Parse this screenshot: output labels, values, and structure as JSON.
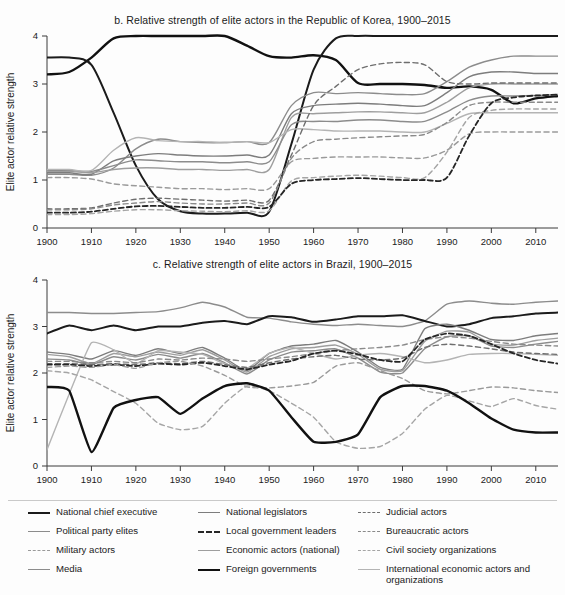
{
  "figure": {
    "panels": [
      {
        "id": "b",
        "title": "b. Relative strength of elite actors in the Republic of Korea, 1900–2015",
        "ylabel": "Elite actor relative strength"
      },
      {
        "id": "c",
        "title": "c. Relative strength of elite actors in Brazil, 1900–2015",
        "ylabel": "Elite actor relative strength"
      }
    ]
  },
  "legend": {
    "columns": [
      [
        {
          "label": "National chief executive",
          "key": "national_chief_executive",
          "color": "#1b1b1b",
          "dash": "solid",
          "width": 2.0
        },
        {
          "label": "Political party elites",
          "key": "political_party_elites",
          "color": "#8c8c8c",
          "dash": "solid",
          "width": 1.4
        },
        {
          "label": "Military actors",
          "key": "military_actors",
          "color": "#9a9a9a",
          "dash": "dashed",
          "width": 1.4
        },
        {
          "label": "Media",
          "key": "media",
          "color": "#8c8c8c",
          "dash": "solid",
          "width": 1.4
        }
      ],
      [
        {
          "label": "National legislators",
          "key": "national_legislators",
          "color": "#7d7d7d",
          "dash": "solid",
          "width": 1.4
        },
        {
          "label": "Local government leaders",
          "key": "local_government_leaders",
          "color": "#262626",
          "dash": "dashed",
          "width": 1.8
        },
        {
          "label": "Economic actors (national)",
          "key": "economic_actors_national",
          "color": "#9e9e9e",
          "dash": "solid",
          "width": 1.4
        },
        {
          "label": "Foreign governments",
          "key": "foreign_governments",
          "color": "#111111",
          "dash": "solid",
          "width": 2.4
        }
      ],
      [
        {
          "label": "Judicial actors",
          "key": "judicial_actors",
          "color": "#6e6e6e",
          "dash": "dashed",
          "width": 1.4
        },
        {
          "label": "Bureaucratic actors",
          "key": "bureaucratic_actors",
          "color": "#8a8a8a",
          "dash": "dashed",
          "width": 1.4
        },
        {
          "label": "Civil society organizations",
          "key": "civil_society_organizations",
          "color": "#a5a5a5",
          "dash": "dashed",
          "width": 1.4
        },
        {
          "label": "International economic actors and organizations",
          "key": "international_economic_actors",
          "color": "#b4b4b4",
          "dash": "solid",
          "width": 1.4
        }
      ]
    ]
  },
  "chart_data": [
    {
      "type": "line",
      "id": "b",
      "title": "b. Relative strength of elite actors in the Republic of Korea, 1900–2015",
      "xlabel": "",
      "ylabel": "Elite actor relative strength",
      "xlim": [
        1900,
        2015
      ],
      "ylim": [
        0,
        4
      ],
      "yticks": [
        0,
        1,
        2,
        3,
        4
      ],
      "xticks": [
        1900,
        1910,
        1920,
        1930,
        1940,
        1950,
        1960,
        1970,
        1980,
        1990,
        2000,
        2010
      ],
      "grid": false,
      "legend_position": "below-figure",
      "x": [
        1900,
        1905,
        1910,
        1915,
        1920,
        1925,
        1930,
        1935,
        1940,
        1945,
        1950,
        1955,
        1960,
        1965,
        1970,
        1975,
        1980,
        1985,
        1990,
        1995,
        2000,
        2005,
        2010,
        2015
      ],
      "series": [
        {
          "name": "Foreign governments",
          "values": [
            3.2,
            3.25,
            3.55,
            3.95,
            4.0,
            4.0,
            4.0,
            4.0,
            4.0,
            3.8,
            3.58,
            3.55,
            3.6,
            3.5,
            3.02,
            3.0,
            3.0,
            2.98,
            2.92,
            2.95,
            2.88,
            2.6,
            2.7,
            2.75
          ]
        },
        {
          "name": "National chief executive",
          "values": [
            3.55,
            3.55,
            3.4,
            2.4,
            1.3,
            0.6,
            0.35,
            0.3,
            0.3,
            0.32,
            0.34,
            1.75,
            3.3,
            3.95,
            4.0,
            4.0,
            4.0,
            4.0,
            4.0,
            4.0,
            4.0,
            4.0,
            4.0,
            4.0
          ]
        },
        {
          "name": "Political party elites",
          "values": [
            1.12,
            1.12,
            1.1,
            1.25,
            1.65,
            1.85,
            1.8,
            1.78,
            1.78,
            1.8,
            1.78,
            2.55,
            2.82,
            2.8,
            2.82,
            2.8,
            2.78,
            2.8,
            3.05,
            3.35,
            3.5,
            3.58,
            3.58,
            3.58
          ]
        },
        {
          "name": "National legislators",
          "values": [
            1.15,
            1.15,
            1.12,
            1.4,
            1.5,
            1.55,
            1.52,
            1.5,
            1.5,
            1.52,
            1.52,
            2.38,
            2.55,
            2.58,
            2.6,
            2.58,
            2.55,
            2.55,
            2.82,
            3.15,
            3.25,
            3.25,
            3.22,
            3.22
          ]
        },
        {
          "name": "Economic actors (national)",
          "values": [
            1.18,
            1.18,
            1.15,
            1.22,
            1.25,
            1.25,
            1.22,
            1.22,
            1.2,
            1.22,
            1.22,
            2.3,
            2.38,
            2.4,
            2.42,
            2.42,
            2.4,
            2.4,
            2.62,
            2.92,
            3.0,
            3.0,
            3.0,
            3.0
          ]
        },
        {
          "name": "Media",
          "values": [
            1.2,
            1.2,
            1.18,
            1.3,
            1.42,
            1.4,
            1.38,
            1.38,
            1.36,
            1.38,
            1.38,
            2.15,
            2.22,
            2.22,
            2.25,
            2.25,
            2.22,
            2.22,
            2.42,
            2.66,
            2.75,
            2.75,
            2.76,
            2.78
          ]
        },
        {
          "name": "International economic actors and organizations",
          "values": [
            1.22,
            1.22,
            1.2,
            1.62,
            1.88,
            1.82,
            1.8,
            1.8,
            1.78,
            1.8,
            1.78,
            2.05,
            2.05,
            2.02,
            2.02,
            2.02,
            2.0,
            2.0,
            2.18,
            2.38,
            2.4,
            2.4,
            2.4,
            2.4
          ]
        },
        {
          "name": "Military actors",
          "values": [
            1.05,
            1.05,
            1.02,
            0.92,
            0.88,
            0.85,
            0.82,
            0.82,
            0.8,
            0.82,
            0.82,
            1.38,
            1.45,
            1.48,
            1.48,
            1.48,
            1.46,
            1.46,
            1.62,
            1.96,
            2.0,
            2.0,
            2.0,
            2.0
          ]
        },
        {
          "name": "Judicial actors",
          "values": [
            0.4,
            0.4,
            0.42,
            0.52,
            0.6,
            0.62,
            0.6,
            0.58,
            0.56,
            0.58,
            0.58,
            1.52,
            2.55,
            2.95,
            3.3,
            3.42,
            3.45,
            3.4,
            3.05,
            3.0,
            3.02,
            3.02,
            3.02,
            3.02
          ]
        },
        {
          "name": "Bureaucratic actors",
          "values": [
            0.38,
            0.38,
            0.4,
            0.48,
            0.52,
            0.55,
            0.52,
            0.5,
            0.5,
            0.52,
            0.52,
            1.45,
            1.8,
            1.85,
            1.88,
            1.9,
            1.92,
            1.95,
            2.2,
            2.55,
            2.62,
            2.62,
            2.62,
            2.62
          ]
        },
        {
          "name": "Civil society organizations",
          "values": [
            0.28,
            0.28,
            0.3,
            0.35,
            0.38,
            0.38,
            0.36,
            0.35,
            0.34,
            0.36,
            0.36,
            0.98,
            1.05,
            1.08,
            1.1,
            1.08,
            1.05,
            1.05,
            1.58,
            2.3,
            2.45,
            2.48,
            2.48,
            2.48
          ]
        },
        {
          "name": "Local government leaders",
          "values": [
            0.32,
            0.32,
            0.34,
            0.4,
            0.45,
            0.46,
            0.44,
            0.42,
            0.42,
            0.44,
            0.44,
            0.92,
            1.0,
            1.02,
            1.04,
            1.02,
            1.0,
            1.0,
            1.05,
            1.92,
            2.6,
            2.72,
            2.76,
            2.78
          ]
        }
      ]
    },
    {
      "type": "line",
      "id": "c",
      "title": "c. Relative strength of elite actors in Brazil, 1900–2015",
      "xlabel": "",
      "ylabel": "Elite actor relative strength",
      "xlim": [
        1900,
        2015
      ],
      "ylim": [
        0,
        4
      ],
      "yticks": [
        0,
        1,
        2,
        3,
        4
      ],
      "xticks": [
        1900,
        1910,
        1920,
        1930,
        1940,
        1950,
        1960,
        1970,
        1980,
        1990,
        2000,
        2010
      ],
      "grid": false,
      "legend_position": "below-figure",
      "x": [
        1900,
        1905,
        1910,
        1915,
        1920,
        1925,
        1930,
        1935,
        1940,
        1945,
        1950,
        1955,
        1960,
        1965,
        1970,
        1975,
        1980,
        1985,
        1990,
        1995,
        2000,
        2005,
        2010,
        2015
      ],
      "series": [
        {
          "name": "Political party elites",
          "values": [
            3.3,
            3.3,
            3.28,
            3.28,
            3.3,
            3.32,
            3.4,
            3.52,
            3.42,
            3.2,
            3.18,
            3.1,
            3.05,
            3.02,
            3.05,
            3.02,
            3.0,
            3.12,
            3.48,
            3.55,
            3.5,
            3.48,
            3.52,
            3.55
          ]
        },
        {
          "name": "National chief executive",
          "values": [
            2.85,
            3.02,
            2.92,
            3.02,
            2.92,
            3.0,
            3.0,
            3.08,
            3.12,
            3.05,
            3.22,
            3.2,
            3.1,
            3.15,
            3.22,
            3.22,
            3.24,
            3.12,
            3.0,
            3.05,
            3.18,
            3.22,
            3.28,
            3.3
          ]
        },
        {
          "name": "National legislators",
          "values": [
            2.45,
            2.4,
            2.3,
            2.48,
            2.38,
            2.52,
            2.42,
            2.55,
            2.32,
            2.05,
            2.42,
            2.58,
            2.62,
            2.7,
            2.45,
            2.12,
            2.08,
            2.95,
            3.05,
            2.92,
            2.72,
            2.7,
            2.8,
            2.85
          ]
        },
        {
          "name": "Economic actors (national)",
          "values": [
            2.4,
            2.35,
            2.2,
            2.42,
            2.35,
            2.45,
            2.38,
            2.5,
            2.28,
            2.02,
            2.35,
            2.52,
            2.55,
            2.6,
            2.4,
            2.08,
            2.05,
            2.68,
            2.9,
            2.88,
            2.62,
            2.6,
            2.7,
            2.75
          ]
        },
        {
          "name": "Media",
          "values": [
            2.3,
            2.28,
            2.18,
            2.35,
            2.28,
            2.4,
            2.32,
            2.42,
            2.22,
            1.98,
            2.28,
            2.45,
            2.48,
            2.52,
            2.32,
            2.02,
            2.0,
            2.52,
            2.78,
            2.8,
            2.58,
            2.55,
            2.62,
            2.68
          ]
        },
        {
          "name": "International economic actors and organizations",
          "values": [
            0.35,
            1.55,
            2.65,
            2.5,
            2.2,
            2.48,
            2.45,
            2.4,
            2.2,
            2.1,
            2.42,
            2.55,
            2.42,
            2.3,
            2.38,
            2.42,
            2.35,
            2.22,
            2.28,
            2.4,
            2.42,
            2.42,
            2.4,
            2.38
          ]
        },
        {
          "name": "Bureaucratic actors",
          "values": [
            2.25,
            2.25,
            2.22,
            2.25,
            2.22,
            2.3,
            2.28,
            2.32,
            2.3,
            2.25,
            2.3,
            2.35,
            2.42,
            2.48,
            2.52,
            2.55,
            2.6,
            2.72,
            2.78,
            2.75,
            2.68,
            2.62,
            2.6,
            2.58
          ]
        },
        {
          "name": "Judicial actors",
          "values": [
            2.2,
            2.2,
            2.18,
            2.2,
            2.18,
            2.22,
            2.2,
            2.25,
            2.18,
            2.12,
            2.22,
            2.3,
            2.35,
            2.38,
            2.3,
            2.28,
            2.32,
            2.55,
            2.62,
            2.58,
            2.52,
            2.45,
            2.42,
            2.4
          ]
        },
        {
          "name": "Local government leaders",
          "values": [
            2.18,
            2.18,
            2.15,
            2.18,
            2.15,
            2.2,
            2.18,
            2.22,
            2.15,
            2.08,
            2.18,
            2.26,
            2.42,
            2.48,
            2.4,
            2.28,
            2.25,
            2.72,
            2.85,
            2.8,
            2.62,
            2.42,
            2.28,
            2.2
          ]
        },
        {
          "name": "Military actors",
          "values": [
            2.12,
            2.15,
            2.12,
            2.18,
            2.1,
            2.22,
            2.25,
            2.15,
            1.95,
            1.7,
            1.68,
            1.72,
            1.8,
            2.15,
            2.22,
            2.05,
            1.88,
            1.62,
            1.55,
            1.62,
            1.7,
            1.68,
            1.62,
            1.58
          ]
        },
        {
          "name": "Civil society organizations",
          "values": [
            2.05,
            2.0,
            1.85,
            1.6,
            1.35,
            0.92,
            0.78,
            0.85,
            1.35,
            1.72,
            1.62,
            1.35,
            1.05,
            0.52,
            0.38,
            0.42,
            0.7,
            1.22,
            1.52,
            1.4,
            1.28,
            1.45,
            1.3,
            1.22
          ]
        },
        {
          "name": "Foreign governments",
          "values": [
            1.7,
            1.62,
            0.3,
            1.25,
            1.42,
            1.48,
            1.12,
            1.45,
            1.72,
            1.78,
            1.62,
            1.05,
            0.52,
            0.52,
            0.68,
            1.48,
            1.72,
            1.72,
            1.62,
            1.35,
            1.02,
            0.78,
            0.72,
            0.72
          ]
        }
      ]
    }
  ]
}
